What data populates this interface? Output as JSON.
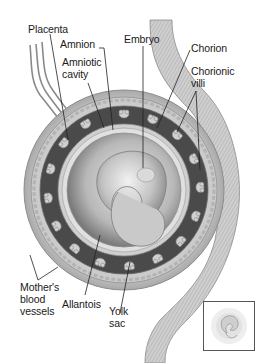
{
  "diagram": {
    "labels": {
      "placenta": "Placenta",
      "amnion": "Amnion",
      "amniotic_cavity": "Amniotic\ncavity",
      "embryo": "Embryo",
      "chorion": "Chorion",
      "chorionic_villi": "Chorionic\nvilli",
      "mothers_blood_vessels": "Mother's\nblood\nvessels",
      "allantois": "Allantois",
      "yolk_sac": "Yolk\nsac"
    },
    "inset": {
      "description": "Small thumbnail of the embryo in its membranes"
    },
    "colors": {
      "background": "#ffffff",
      "text": "#1a1a1a",
      "leader_line": "#222222",
      "villi_layer": "#4a4a4a",
      "membrane": "#d8d8d8",
      "embryo": "#bdbdbd"
    }
  }
}
